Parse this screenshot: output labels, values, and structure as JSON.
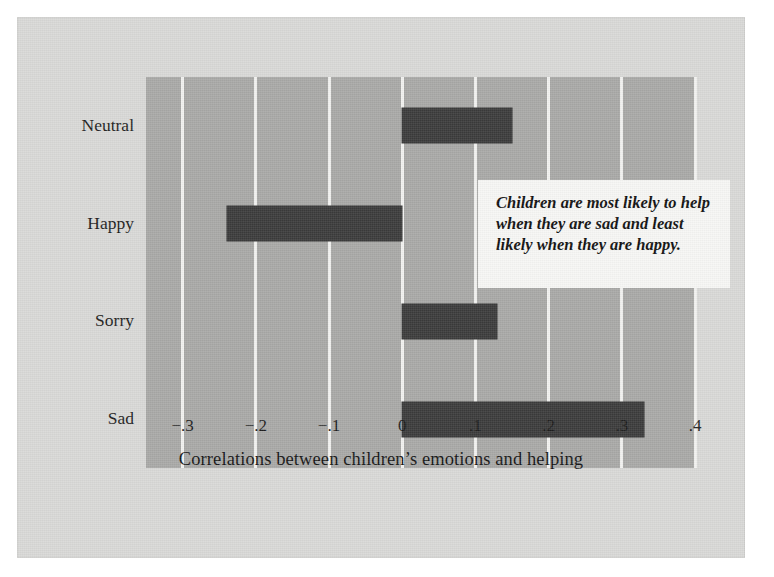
{
  "chart_data": {
    "type": "bar",
    "orientation": "horizontal",
    "title": "",
    "xlabel": "Correlations between children’s emotions and helping",
    "ylabel": "",
    "categories": [
      "Neutral",
      "Happy",
      "Sorry",
      "Sad"
    ],
    "values": [
      0.15,
      -0.24,
      0.13,
      0.33
    ],
    "series": [
      {
        "name": "Correlation with helping",
        "values": [
          0.15,
          -0.24,
          0.13,
          0.33
        ]
      }
    ],
    "xlim": [
      -0.35,
      0.4
    ],
    "xticks": [
      -0.3,
      -0.2,
      -0.1,
      0,
      0.1,
      0.2,
      0.3,
      0.4
    ],
    "xticklabels": [
      "−.3",
      "−.2",
      "−.1",
      "0",
      ".1",
      ".2",
      ".3",
      ".4"
    ],
    "grid": "vertical",
    "legend": "none",
    "annotations": [
      {
        "text": "Children are most likely to help when they are sad and least likely when they are happy.",
        "style": "bold-italic-callout-box"
      }
    ],
    "colors": {
      "bar": "#3b3b3b",
      "plot_background": "#a9a9a7",
      "figure_background": "#d9d9d7",
      "gridline": "#f2f2f0",
      "annotation_background": "#f7f7f5",
      "text": "#1d1d1d"
    }
  },
  "axis": {
    "title": "Correlations between children’s emotions and helping",
    "ticks": [
      {
        "label": "−.3",
        "value": -0.3
      },
      {
        "label": "−.2",
        "value": -0.2
      },
      {
        "label": "−.1",
        "value": -0.1
      },
      {
        "label": "0",
        "value": 0
      },
      {
        "label": ".1",
        "value": 0.1
      },
      {
        "label": ".2",
        "value": 0.2
      },
      {
        "label": ".3",
        "value": 0.3
      },
      {
        "label": ".4",
        "value": 0.4
      }
    ]
  },
  "categories": [
    {
      "label": "Neutral",
      "value": 0.15
    },
    {
      "label": "Happy",
      "value": -0.24
    },
    {
      "label": "Sorry",
      "value": 0.13
    },
    {
      "label": "Sad",
      "value": 0.33
    }
  ],
  "annotation": {
    "text": "Children are most likely to help when they are sad and least likely when they are happy."
  }
}
